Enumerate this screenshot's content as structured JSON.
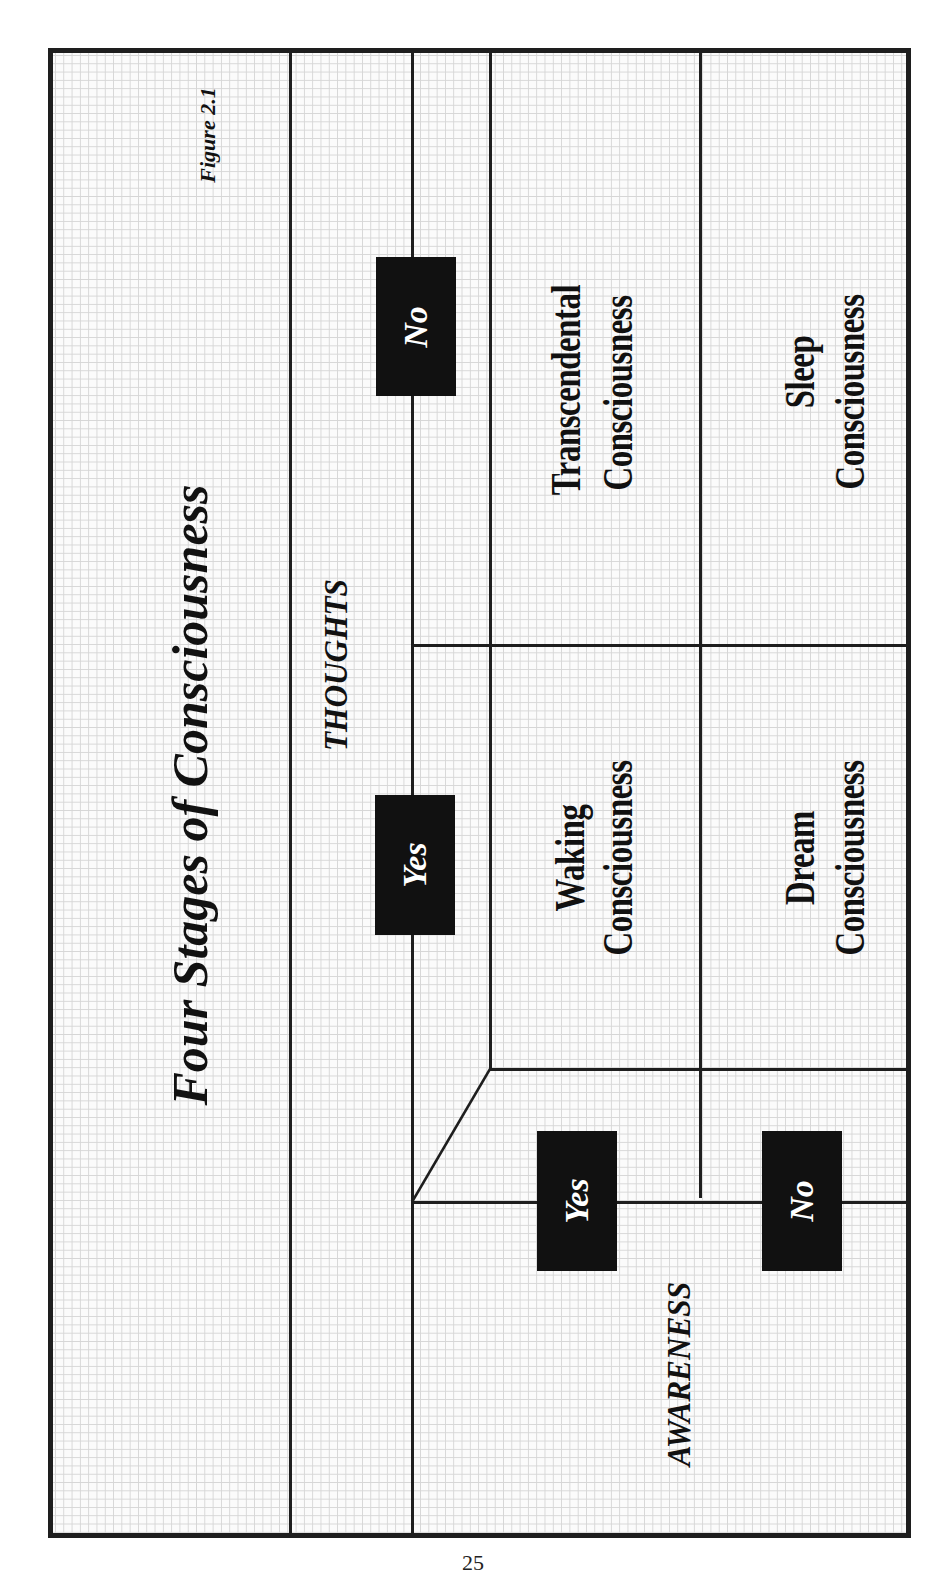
{
  "figure": {
    "label": "Figure 2.1",
    "title": "Four Stages of Consciousness",
    "axes": {
      "thoughts": {
        "label": "THOUGHTS",
        "options": [
          "Yes",
          "No"
        ]
      },
      "awareness": {
        "label": "AWARENESS",
        "options": [
          "Yes",
          "No"
        ]
      }
    },
    "cells": [
      {
        "thoughts": "Yes",
        "awareness": "Yes",
        "line1": "Waking",
        "line2": "Consciousness"
      },
      {
        "thoughts": "No",
        "awareness": "Yes",
        "line1": "Transcendental",
        "line2": "Consciousness"
      },
      {
        "thoughts": "Yes",
        "awareness": "No",
        "line1": "Dream",
        "line2": "Consciousness"
      },
      {
        "thoughts": "No",
        "awareness": "No",
        "line1": "Sleep",
        "line2": "Consciousness"
      }
    ]
  },
  "page_number": "25"
}
